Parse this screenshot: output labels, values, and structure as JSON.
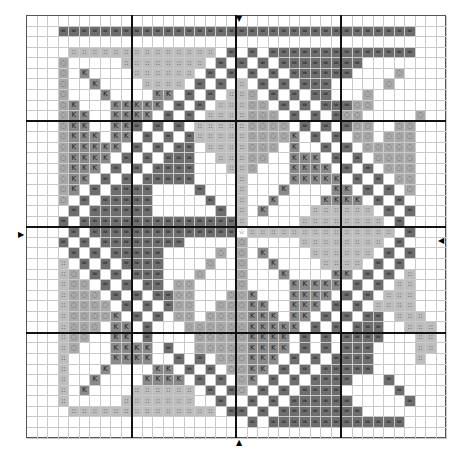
{
  "chart": {
    "title": "",
    "grid_size": {
      "cols": 40,
      "rows": 40
    },
    "major_line_every": 10,
    "center_marker": "star",
    "legend": {
      "D": {
        "symbol": "=",
        "color": "#6e6e6e",
        "name": "dark-gray"
      },
      "L": {
        "symbol": "::",
        "color": "#bdbdbd",
        "name": "light-gray-dots"
      },
      "O": {
        "symbol": "◌",
        "color": "#a9a9a9",
        "name": "gray-circle"
      },
      "K": {
        "symbol": "K",
        "color": "#8a8a8a",
        "name": "medium-gray-k"
      },
      "S": {
        "symbol": "☆",
        "color": "#ffffff",
        "name": "center-star"
      },
      ".": {
        "symbol": "",
        "color": "#ffffff",
        "name": "blank"
      }
    },
    "center_arrows": {
      "top": "▼",
      "bottom": "▲",
      "left": "▶",
      "right": "◀"
    },
    "rows": [
      "........................................",
      "...DDDDDDDDDDDDDDDDDDDDDDDDDDDDDDDDDD...",
      "........................................",
      "....LLLLLLLLLLLLLL.D.D.DDDDDDDDDDDDDD...",
      "...O.....LLLLLLLL.D.D.D.DDDDDDDD........",
      "...O.K....LLLLLL.D.D.D.D.DDDDDD....O....",
      "...O..K....LLLL.D.D.L.D.D.DDD.....O.....",
      "...O...K....KK.D.D.LLO.D.D.DD...O.......",
      "...OK...KKKKK.D.D.LLLOO.D.D.DDDOO.......",
      "...OKK..KKKK.D.D.LLLLOOO.D.D.DOO.....O..",
      "...OKK..KKD.D.D.LLLLLOOOO.D.D.DOO..OO...",
      "...OKKK.KK.D.D.DLLLLLOOOOK.D.D.OO.OOO...",
      "...OKKKKK.D.D.DD.LLLLOOO.K..D.D.OOOOO...",
      "...OKKKK.D.D.DDD..LLLOO..KKK.D.D.OOOO...",
      "...OKKK.D.D.DDDD...LLO...KKKK.D.D.OOO...",
      "...OKK.D.D.DDDDD....L....KKKKK.D.D.OO...",
      "...OK.D.DDDD....D...L...K....KK.D.D.O...",
      "...O.D.DDDDD.....D..L..K....KKKK.D.D....",
      "....D.DDDDDD......D.L.K....LLLLLL.D.D...",
      "...D.DDDDDDDDDDDDDDDL.....LLLLLLLL.D....",
      "....D.DDDDDDDDDDDDDDSLLLLLLLLLLLLLL.D...",
      "...D.D.DDDDDDDD.....O.....LLLLLLLL.D....",
      "....D.D.DDDDD.....O.O.K....LLLLLL.D.D...",
      "...L.D.D.DDDD....O..O..K....LLLL.D.D....",
      "...LO.D.D.DDD...O...O...K....KK.D.D.L...",
      "...LOO.D.D.DD.OO....O....KKKKK.D.D.LL...",
      "...LOOO.D.D.DDOO...OOK...KKKK.D.D.LLL...",
      "...LOOOO.D.D.DOO..OOOKK..KKK.D.D.LLLL...",
      "...LOOOOK.D.D.OO.OOOOKKK.KK.D.D.DD.LLL..",
      "...LOOO.KK.D...OOOOOOKKKKK.D.D.DDD..LLL.",
      "...LOO..KK.D....OOOOOKKKK.D.D.DDDD...LL.",
      "...LO...KKKK.D..OOOOOKKKK.D.D.DDD....LL.",
      "...L....KKKK..D.D.OOOKKK.D.D.DDDD....L..",
      "...L...K....KK.D.D.OOKK.D.D.DDDDD.......",
      "...L..K....KKKK.D.D.OK.D.D.DDDD...D.....",
      "...L.K....LLLLLL.D.DO.D.D.DDDD.....D....",
      "...L.....LLLLLLL..D..D.D.DDDDDD.....D...",
      "....LLLLLLLLLLLLLL.DD.D.DDDDDDDD........",
      ".....................D.DDDDDDDDDDDDD....",
      "........................................"
    ]
  }
}
